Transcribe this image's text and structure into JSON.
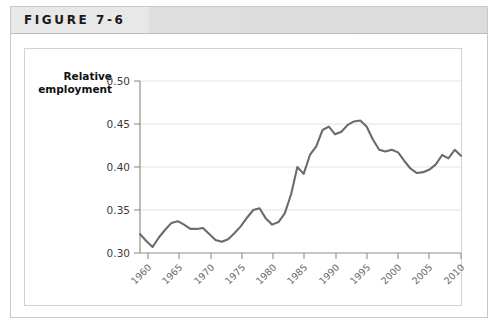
{
  "figure": {
    "label": "FIGURE 7-6"
  },
  "axes": {
    "y_title_line1": "Relative",
    "y_title_line2": "employment",
    "y_ticks": [
      "0.50",
      "0.45",
      "0.40",
      "0.35",
      "0.30"
    ],
    "x_ticks": [
      "1960",
      "1965",
      "1970",
      "1975",
      "1980",
      "1985",
      "1990",
      "1995",
      "2000",
      "2005",
      "2010"
    ]
  },
  "colors": {
    "line": "#6b6b6b",
    "grid": "#e3e3e3",
    "axis": "#8f8f8f",
    "header_band": "#e8e8e8",
    "card_border": "#d2d2d2",
    "title_text": "#1a1a1a",
    "tick_text": "#6a6a6a"
  },
  "chart_data": {
    "type": "line",
    "title": "FIGURE 7-6",
    "xlabel": "",
    "ylabel": "Relative employment",
    "xlim": [
      1959,
      2010
    ],
    "ylim": [
      0.3,
      0.5
    ],
    "yticks": [
      0.3,
      0.35,
      0.4,
      0.45,
      0.5
    ],
    "xticks": [
      1960,
      1965,
      1970,
      1975,
      1980,
      1985,
      1990,
      1995,
      2000,
      2005,
      2010
    ],
    "grid": true,
    "legend": false,
    "series": [
      {
        "name": "Relative employment",
        "x": [
          1959,
          1960,
          1961,
          1962,
          1963,
          1964,
          1965,
          1966,
          1967,
          1968,
          1969,
          1970,
          1971,
          1972,
          1973,
          1974,
          1975,
          1976,
          1977,
          1978,
          1979,
          1980,
          1981,
          1982,
          1983,
          1984,
          1985,
          1986,
          1987,
          1988,
          1989,
          1990,
          1991,
          1992,
          1993,
          1994,
          1995,
          1996,
          1997,
          1998,
          1999,
          2000,
          2001,
          2002,
          2003,
          2004,
          2005,
          2006,
          2007,
          2008,
          2009,
          2010
        ],
        "y": [
          0.322,
          0.314,
          0.307,
          0.318,
          0.327,
          0.335,
          0.337,
          0.333,
          0.328,
          0.328,
          0.329,
          0.322,
          0.315,
          0.313,
          0.316,
          0.323,
          0.331,
          0.341,
          0.35,
          0.352,
          0.34,
          0.333,
          0.336,
          0.346,
          0.368,
          0.4,
          0.392,
          0.414,
          0.424,
          0.443,
          0.447,
          0.438,
          0.441,
          0.449,
          0.453,
          0.454,
          0.447,
          0.432,
          0.42,
          0.418,
          0.42,
          0.417,
          0.407,
          0.398,
          0.393,
          0.394,
          0.397,
          0.403,
          0.414,
          0.41,
          0.42,
          0.413
        ]
      }
    ]
  }
}
